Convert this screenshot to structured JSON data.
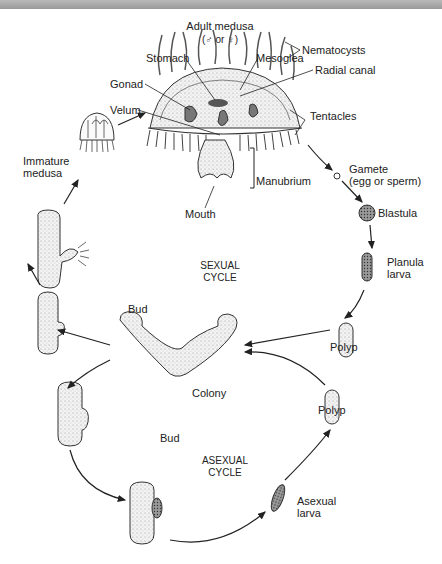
{
  "title": "Adult medusa",
  "title_sub": "(♂ or ♀)",
  "labels": {
    "stomach": "Stomach",
    "mesoglea": "Mesoglea",
    "nematocysts": "Nematocysts",
    "gonad": "Gonad",
    "radial_canal": "Radial canal",
    "velum": "Velum",
    "tentacles": "Tentacles",
    "manubrium": "Manubrium",
    "mouth": "Mouth",
    "immature_medusa_1": "Immature",
    "immature_medusa_2": "medusa",
    "gamete_1": "Gamete",
    "gamete_2": "(egg or sperm)",
    "blastula": "Blastula",
    "planula_1": "Planula",
    "planula_2": "larva",
    "sexual_cycle_1": "SEXUAL",
    "sexual_cycle_2": "CYCLE",
    "bud_upper": "Bud",
    "polyp_upper": "Polyp",
    "colony": "Colony",
    "bud_lower": "Bud",
    "polyp_lower": "Polyp",
    "asexual_cycle_1": "ASEXUAL",
    "asexual_cycle_2": "CYCLE",
    "asexual_larva_1": "Asexual",
    "asexual_larva_2": "larva"
  },
  "colors": {
    "line": "#222222",
    "fill": "#eeeeee",
    "dark_fill": "#777777",
    "topbar": "#a8a8a8"
  }
}
